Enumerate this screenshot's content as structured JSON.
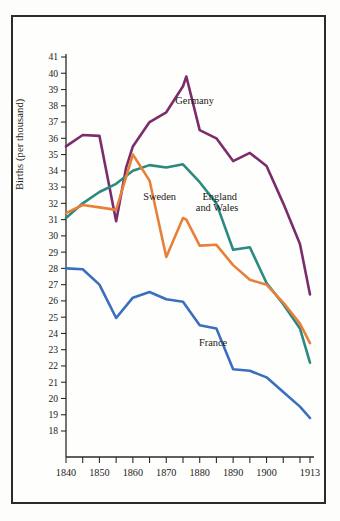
{
  "figure": {
    "frame_color": "#2b2b2b",
    "background": "#fefefc"
  },
  "axis": {
    "ylabel": "Births (per thousand)",
    "y_ticks": [
      41,
      40,
      39,
      38,
      37,
      36,
      35,
      34,
      33,
      32,
      31,
      30,
      29,
      28,
      27,
      26,
      25,
      24,
      23,
      22,
      21,
      20,
      19,
      18
    ],
    "x_tick_labels": [
      "1840",
      "1850",
      "1860",
      "1870",
      "1880",
      "1890",
      "1900",
      "1913"
    ],
    "x_tick_values": [
      1840,
      1845,
      1850,
      1855,
      1860,
      1865,
      1870,
      1875,
      1880,
      1885,
      1890,
      1895,
      1900,
      1905,
      1910,
      1913
    ]
  },
  "annotations": [
    {
      "name": "germany-label",
      "text": "Germany",
      "x": 1878.5,
      "y": 38.1
    },
    {
      "name": "sweden-label",
      "text": "Sweden",
      "x": 1868.0,
      "y": 32.2
    },
    {
      "name": "england-label-line1",
      "text": "England",
      "x": 1886.0,
      "y": 32.2
    },
    {
      "name": "england-label-line2",
      "text": "and Wales",
      "x": 1885.2,
      "y": 31.5
    },
    {
      "name": "france-label",
      "text": "France",
      "x": 1884.0,
      "y": 23.2
    }
  ],
  "chart_data": {
    "type": "line",
    "title": "",
    "xlabel": "",
    "ylabel": "Births (per thousand)",
    "xlim": [
      1840,
      1913
    ],
    "ylim": [
      18,
      41
    ],
    "grid": false,
    "legend": "inline-annotations",
    "series": [
      {
        "name": "Germany",
        "color": "#7b2d6b",
        "x": [
          1840,
          1845,
          1850,
          1855,
          1858,
          1860,
          1865,
          1870,
          1875,
          1876,
          1880,
          1885,
          1890,
          1895,
          1900,
          1905,
          1910,
          1913
        ],
        "values": [
          35.5,
          36.2,
          36.15,
          30.9,
          34.2,
          35.5,
          37.0,
          37.6,
          39.2,
          39.8,
          36.5,
          36.0,
          34.6,
          35.1,
          34.3,
          32.0,
          29.5,
          26.4
        ]
      },
      {
        "name": "England and Wales",
        "color": "#2b8a80",
        "x": [
          1840,
          1845,
          1850,
          1855,
          1860,
          1865,
          1870,
          1875,
          1880,
          1885,
          1890,
          1895,
          1900,
          1905,
          1910,
          1913
        ],
        "values": [
          31.1,
          32.0,
          32.7,
          33.2,
          34.0,
          34.35,
          34.2,
          34.4,
          33.3,
          32.0,
          29.15,
          29.3,
          27.1,
          25.8,
          24.3,
          22.2
        ]
      },
      {
        "name": "Sweden",
        "color": "#e8803a",
        "x": [
          1840,
          1845,
          1850,
          1855,
          1860,
          1865,
          1870,
          1875,
          1876,
          1880,
          1885,
          1890,
          1895,
          1900,
          1905,
          1910,
          1913
        ],
        "values": [
          31.4,
          31.9,
          31.75,
          31.6,
          35.0,
          33.4,
          28.7,
          31.1,
          31.0,
          29.4,
          29.45,
          28.2,
          27.3,
          27.0,
          25.9,
          24.6,
          23.4
        ]
      },
      {
        "name": "France",
        "color": "#3a6fbf",
        "x": [
          1840,
          1845,
          1850,
          1855,
          1860,
          1865,
          1870,
          1875,
          1880,
          1885,
          1890,
          1895,
          1900,
          1905,
          1910,
          1913
        ],
        "values": [
          28.0,
          27.95,
          27.0,
          24.95,
          26.2,
          26.55,
          26.1,
          25.95,
          24.5,
          24.3,
          21.8,
          21.7,
          21.3,
          20.4,
          19.5,
          18.8
        ]
      }
    ]
  }
}
